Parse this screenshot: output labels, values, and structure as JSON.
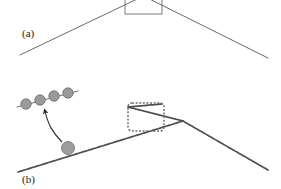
{
  "figure": {
    "width": 281,
    "height": 189,
    "background_color": "#ffffff"
  },
  "panels": [
    {
      "id": "a",
      "label": "(a)",
      "label_x": 22,
      "label_y": 37,
      "line_color": "#595959",
      "line_width": 0.9,
      "vertex": {
        "x": 143.5,
        "y": -4
      },
      "left_end": {
        "x": 20,
        "y": 55
      },
      "right_end": {
        "x": 268,
        "y": 58
      },
      "box": {
        "name": "kink-box-solid",
        "x": 125,
        "y": -8,
        "width": 37,
        "height": 22,
        "stroke": "#6e6e6e",
        "stroke_width": 0.9,
        "fill": "none",
        "style": "solid"
      }
    },
    {
      "id": "b",
      "label": "(b)",
      "label_x": 22,
      "label_y": 183,
      "chain_color": "#4d4d4d",
      "chain_width": 1.6,
      "bead_pattern_spacing": 2.2,
      "vertex": {
        "x": 183,
        "y": 121
      },
      "left_end": {
        "x": 18,
        "y": 172
      },
      "right_end": {
        "x": 268,
        "y": 170
      },
      "crossing_branch": {
        "start_x": 128,
        "start_y": 107,
        "end_x": 183,
        "end_y": 121
      },
      "box": {
        "name": "kink-box-dashed",
        "x": 128,
        "y": 103,
        "width": 36,
        "height": 28,
        "stroke": "#707070",
        "stroke_width": 1.4,
        "fill": "none",
        "style": "dashed",
        "dash_array": "2,1.6",
        "corner_radius": 4
      },
      "highlight_bead": {
        "name": "highlighted-monomer",
        "cx": 68,
        "cy": 148,
        "r": 6.5,
        "fill": "#9e9e9e",
        "stroke": "#6b6b6b"
      },
      "arrow": {
        "name": "magnify-arrow",
        "path": "M 62 142 C 52 132 48 124 45 113",
        "head_x": 44,
        "head_y": 108,
        "color": "#2b2b2b",
        "width": 1.1
      },
      "inset": {
        "name": "bead-chain-inset",
        "line_start": {
          "x": 17,
          "y": 107
        },
        "line_end": {
          "x": 78,
          "y": 91
        },
        "line_color": "#6e6e6e",
        "line_width": 1.0,
        "bead_fill": "#9a9a9a",
        "bead_stroke": "#6b6b6b",
        "bead_radius": 5.2,
        "beads": [
          {
            "cx": 26,
            "cy": 104
          },
          {
            "cx": 40,
            "cy": 100
          },
          {
            "cx": 54,
            "cy": 96
          },
          {
            "cx": 68,
            "cy": 93
          }
        ]
      }
    }
  ],
  "colors": {
    "ink": "#1a1a1a",
    "line_gray": "#595959",
    "chain_gray": "#4d4d4d",
    "bead_gray": "#9a9a9a",
    "bead_edge": "#6b6b6b",
    "box_gray": "#707070",
    "background": "#ffffff"
  }
}
